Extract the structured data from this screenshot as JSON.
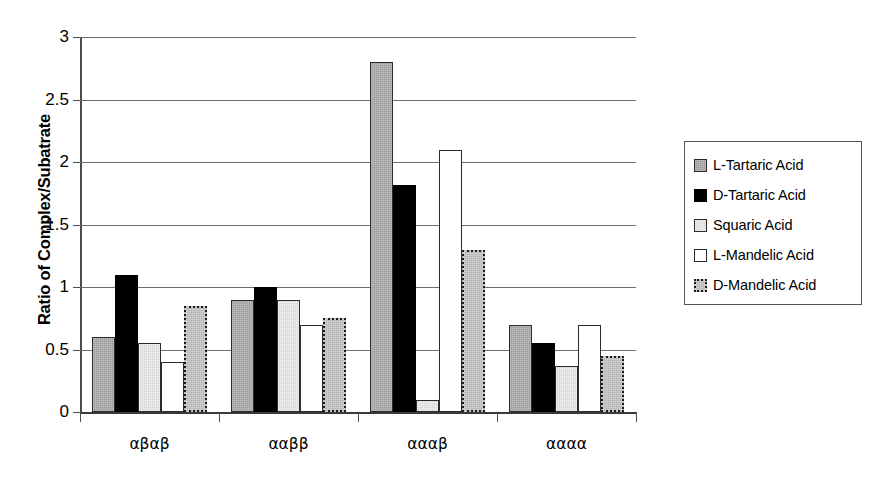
{
  "chart_data": {
    "type": "bar",
    "title": "",
    "xlabel": "",
    "ylabel": "Ratio of Complex/Subatrate",
    "ylim": [
      0,
      3
    ],
    "yticks": [
      "0",
      "0.5",
      "1",
      "1.5",
      "2",
      "2.5",
      "3"
    ],
    "grid": true,
    "legend_position": "right",
    "categories": [
      "αβαβ",
      "ααββ",
      "αααβ",
      "αααα"
    ],
    "series": [
      {
        "name": "L-Tartaric Acid",
        "color": "#9d9d9d",
        "values": [
          0.6,
          0.9,
          2.8,
          0.7
        ]
      },
      {
        "name": "D-Tartaric Acid",
        "color": "#000000",
        "values": [
          1.1,
          1.0,
          1.82,
          0.55
        ]
      },
      {
        "name": "Squaric Acid",
        "color": "#d8d8d8",
        "values": [
          0.55,
          0.9,
          0.1,
          0.37
        ]
      },
      {
        "name": "L-Mandelic Acid",
        "color": "#ffffff",
        "values": [
          0.4,
          0.7,
          2.1,
          0.7
        ]
      },
      {
        "name": "D-Mandelic Acid",
        "color": "#b4b4b4",
        "values": [
          0.85,
          0.75,
          1.3,
          0.45
        ]
      }
    ]
  },
  "legend": {
    "items": [
      {
        "label": "L-Tartaric Acid"
      },
      {
        "label": "D-Tartaric Acid"
      },
      {
        "label": "Squaric Acid"
      },
      {
        "label": "L-Mandelic Acid"
      },
      {
        "label": "D-Mandelic Acid"
      }
    ]
  }
}
